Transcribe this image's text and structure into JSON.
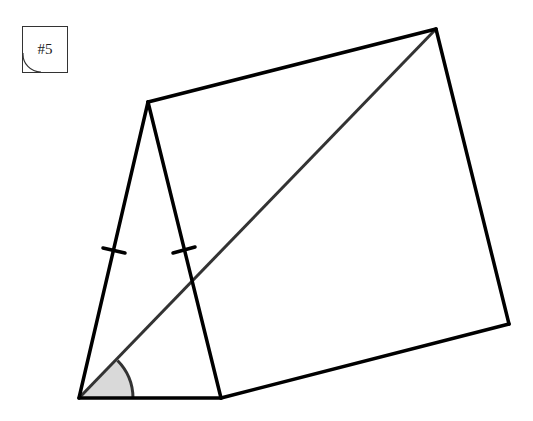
{
  "figure": {
    "label": "#5",
    "colors": {
      "edge": "#000000",
      "diagonal": "#333333",
      "angle_fill": "#d9d9d9",
      "angle_stroke": "#333333"
    },
    "vertices": {
      "A": [
        79,
        398
      ],
      "B": [
        221,
        398
      ],
      "C": [
        148,
        102
      ],
      "D": [
        436,
        29
      ],
      "E": [
        509,
        324
      ]
    },
    "edges": [
      [
        "A",
        "B"
      ],
      [
        "A",
        "C"
      ],
      [
        "B",
        "C"
      ],
      [
        "C",
        "D"
      ],
      [
        "D",
        "E"
      ],
      [
        "B",
        "E"
      ]
    ],
    "diagonal": [
      "A",
      "D"
    ],
    "congruence_marks": [
      "A-C",
      "B-C"
    ],
    "marked_angle": "D-A-B"
  }
}
